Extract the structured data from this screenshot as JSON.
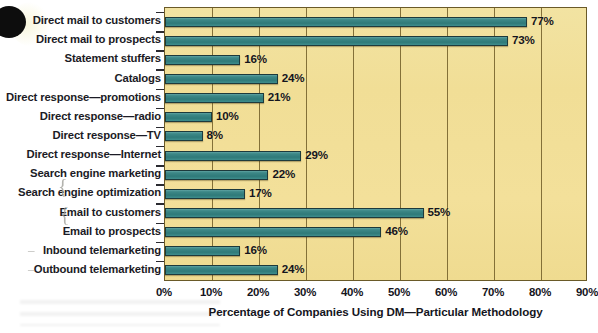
{
  "chart_data": {
    "type": "bar",
    "orientation": "horizontal",
    "title": "",
    "xlabel": "Percentage of Companies Using DM—Particular Methodology",
    "ylabel": "",
    "xlim": [
      0,
      90
    ],
    "xtick_labels": [
      "0%",
      "10%",
      "20%",
      "30%",
      "40%",
      "50%",
      "60%",
      "70%",
      "80%",
      "90%"
    ],
    "xticks": [
      0,
      10,
      20,
      30,
      40,
      50,
      60,
      70,
      80,
      90
    ],
    "grid": true,
    "legend": "none",
    "categories": [
      "Direct mail to customers",
      "Direct mail to prospects",
      "Statement stuffers",
      "Catalogs",
      "Direct response—promotions",
      "Direct response—radio",
      "Direct response—TV",
      "Direct response—Internet",
      "Search engine marketing",
      "Search engine optimization",
      "Email to customers",
      "Email to prospects",
      "Inbound telemarketing",
      "Outbound telemarketing"
    ],
    "values": [
      77,
      73,
      16,
      24,
      21,
      10,
      8,
      29,
      22,
      17,
      55,
      46,
      16,
      24
    ],
    "value_labels": [
      "77%",
      "73%",
      "16%",
      "24%",
      "21%",
      "10%",
      "8%",
      "29%",
      "22%",
      "17%",
      "55%",
      "46%",
      "16%",
      "24%"
    ],
    "bar_color": "#3d8887",
    "bar_edge_color": "#1d3a3c",
    "plot_background": "#f1de96",
    "grid_color": "#7a6630",
    "text_color": "#15151d"
  },
  "annotations": {
    "pencil_marks": [
      "{",
      "{",
      "–",
      "–"
    ]
  }
}
